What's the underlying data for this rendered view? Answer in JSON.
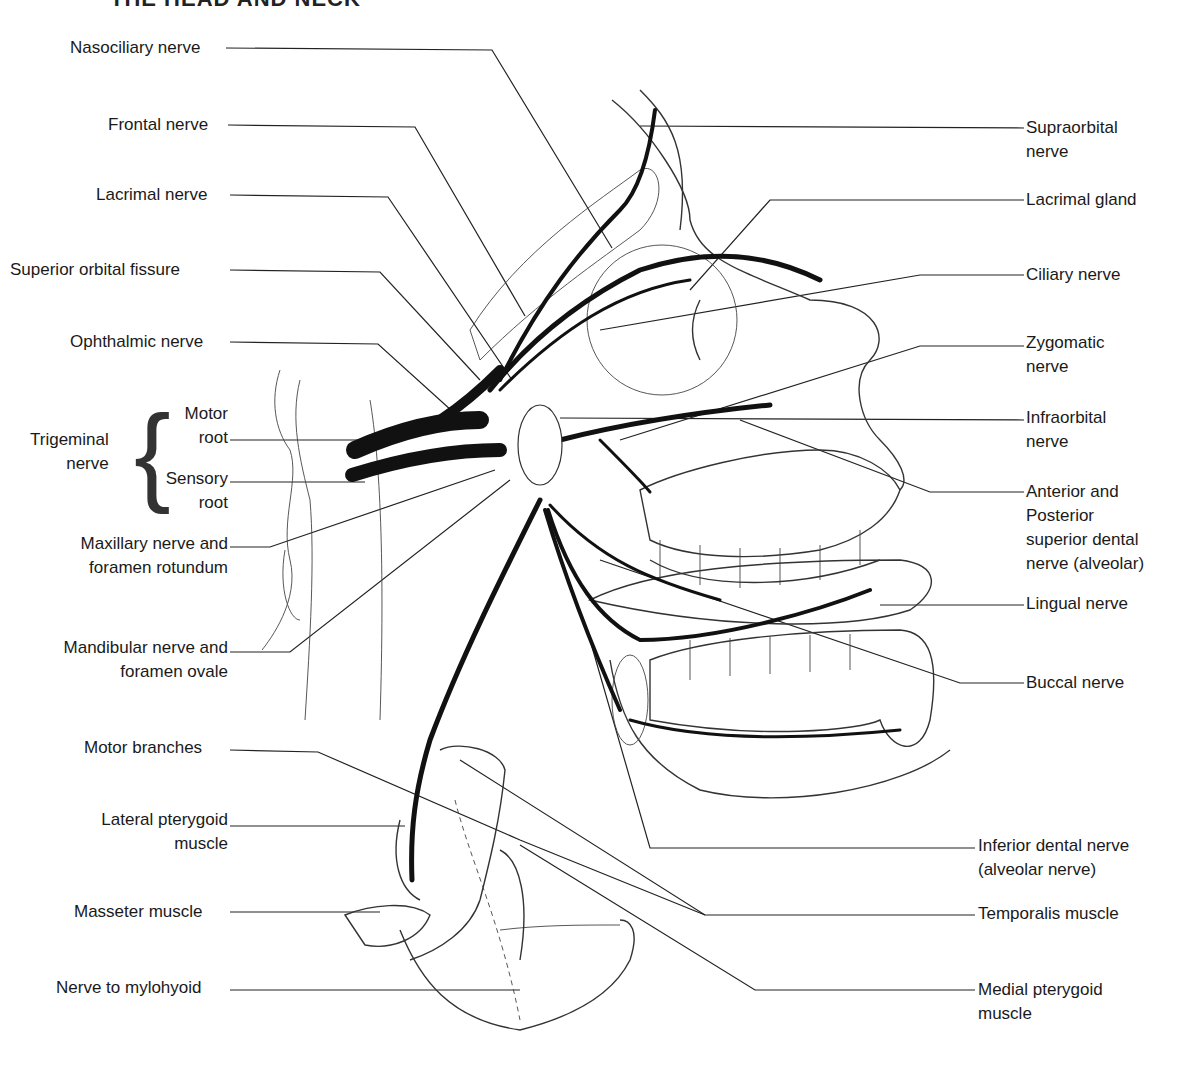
{
  "header": {
    "title": "THE HEAD AND NECK"
  },
  "labels_left": {
    "nasociliary": "Nasociliary nerve",
    "frontal": "Frontal nerve",
    "lacrimal": "Lacrimal nerve",
    "sup_orbital_fissure": "Superior orbital fissure",
    "ophthalmic": "Ophthalmic nerve",
    "trigeminal_1": "Trigeminal",
    "trigeminal_2": "nerve",
    "motor_1": "Motor",
    "motor_2": "root",
    "sensory_1": "Sensory",
    "sensory_2": "root",
    "maxillary_1": "Maxillary nerve and",
    "maxillary_2": "foramen rotundum",
    "mandibular_1": "Mandibular nerve and",
    "mandibular_2": "foramen ovale",
    "motor_branches": "Motor branches",
    "lat_pterygoid_1": "Lateral pterygoid",
    "lat_pterygoid_2": "muscle",
    "masseter": "Masseter muscle",
    "mylohyoid": "Nerve to mylohyoid"
  },
  "labels_right": {
    "supraorbital_1": "Supraorbital",
    "supraorbital_2": "nerve",
    "lacrimal_gland": "Lacrimal gland",
    "ciliary": "Ciliary nerve",
    "zygomatic_1": "Zygomatic",
    "zygomatic_2": "nerve",
    "infraorbital_1": "Infraorbital",
    "infraorbital_2": "nerve",
    "sup_dental_1": "Anterior and",
    "sup_dental_2": "Posterior",
    "sup_dental_3": "superior dental",
    "sup_dental_4": "nerve (alveolar)",
    "lingual": "Lingual nerve",
    "buccal": "Buccal nerve",
    "inf_dental_1": "Inferior dental nerve",
    "inf_dental_2": "(alveolar nerve)",
    "temporalis": "Temporalis muscle",
    "med_pterygoid_1": "Medial pterygoid",
    "med_pterygoid_2": "muscle"
  }
}
